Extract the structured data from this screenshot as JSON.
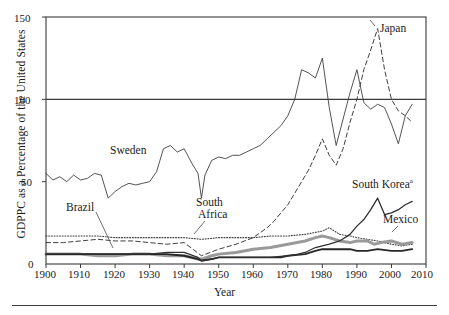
{
  "figure": {
    "ylabel": "GDPPC as a Percentage of the United States",
    "xlabel": "Year",
    "footnote_marker": "a"
  },
  "axis": {
    "y_ticks": [
      "0",
      "50",
      "100",
      "150"
    ],
    "x_ticks": [
      "1900",
      "1910",
      "1920",
      "1930",
      "1940",
      "1950",
      "1960",
      "1970",
      "1980",
      "1990",
      "2000",
      "2010"
    ]
  },
  "annotations": {
    "japan": "Japan",
    "sweden": "Sweden",
    "south_korea": "South Korea",
    "mexico": "Mexico",
    "brazil": "Brazil",
    "south_africa_l1": "South",
    "south_africa_l2": "Africa"
  },
  "colors": {
    "axis": "#3a3a3a",
    "sweden": "#404040",
    "japan": "#404040",
    "south_korea": "#303030",
    "mexico": "#9a9a9a",
    "brazil": "#262626",
    "south_africa": "#404040",
    "background": "#ffffff"
  },
  "chart_data": {
    "type": "line",
    "title": "",
    "xlabel": "Year",
    "ylabel": "GDPPC as a Percentage of the United States",
    "xlim": [
      1900,
      2010
    ],
    "ylim": [
      0,
      150
    ],
    "yticks": [
      0,
      50,
      100,
      150
    ],
    "xticks": [
      1900,
      1910,
      1920,
      1930,
      1940,
      1950,
      1960,
      1970,
      1980,
      1990,
      2000,
      2010
    ],
    "grid": false,
    "legend": "inline-annotations",
    "series": [
      {
        "name": "Sweden",
        "style": "solid-thin",
        "color": "#404040",
        "x": [
          1900,
          1902,
          1904,
          1906,
          1908,
          1910,
          1912,
          1914,
          1916,
          1918,
          1920,
          1922,
          1924,
          1926,
          1928,
          1930,
          1932,
          1934,
          1936,
          1938,
          1940,
          1942,
          1944,
          1945,
          1946,
          1948,
          1950,
          1952,
          1954,
          1956,
          1958,
          1960,
          1962,
          1964,
          1966,
          1968,
          1970,
          1972,
          1974,
          1976,
          1978,
          1980,
          1982,
          1984,
          1986,
          1988,
          1990,
          1992,
          1994,
          1996,
          1998,
          2000,
          2002,
          2004,
          2006
        ],
        "y": [
          55,
          51,
          53,
          50,
          54,
          51,
          52,
          55,
          54,
          40,
          44,
          47,
          49,
          48,
          49,
          50,
          56,
          70,
          72,
          68,
          70,
          62,
          55,
          40,
          54,
          63,
          65,
          64,
          66,
          66,
          68,
          70,
          72,
          76,
          80,
          84,
          90,
          100,
          118,
          116,
          113,
          125,
          95,
          72,
          88,
          104,
          118,
          98,
          94,
          97,
          95,
          85,
          73,
          90,
          97
        ]
      },
      {
        "name": "Japan",
        "style": "dashed",
        "color": "#404040",
        "x": [
          1900,
          1905,
          1910,
          1915,
          1920,
          1925,
          1930,
          1935,
          1940,
          1945,
          1950,
          1955,
          1960,
          1962,
          1964,
          1966,
          1968,
          1970,
          1972,
          1974,
          1976,
          1978,
          1980,
          1982,
          1984,
          1986,
          1988,
          1990,
          1992,
          1994,
          1996,
          1998,
          2000,
          2002,
          2004,
          2006
        ],
        "y": [
          13,
          13,
          14,
          15,
          14,
          14,
          13,
          12,
          13,
          5,
          9,
          12,
          16,
          19,
          22,
          26,
          31,
          36,
          43,
          50,
          57,
          66,
          76,
          66,
          60,
          70,
          86,
          100,
          118,
          130,
          143,
          118,
          100,
          93,
          90,
          86
        ]
      },
      {
        "name": "South Africa",
        "style": "dotted",
        "color": "#404040",
        "x": [
          1900,
          1905,
          1910,
          1915,
          1920,
          1925,
          1930,
          1935,
          1940,
          1945,
          1950,
          1955,
          1960,
          1965,
          1970,
          1975,
          1980,
          1982,
          1985,
          1988,
          1990,
          1993,
          1996,
          2000,
          2003,
          2006
        ],
        "y": [
          17,
          17,
          17,
          17,
          16,
          16,
          16,
          16,
          16,
          15,
          16,
          16,
          16,
          17,
          17,
          18,
          20,
          22,
          18,
          17,
          16,
          15,
          14,
          12,
          11,
          12
        ]
      },
      {
        "name": "Mexico",
        "style": "solid-thick-gray",
        "color": "#9a9a9a",
        "x": [
          1900,
          1905,
          1910,
          1915,
          1920,
          1925,
          1930,
          1935,
          1940,
          1944,
          1945,
          1948,
          1950,
          1955,
          1960,
          1965,
          1970,
          1975,
          1978,
          1980,
          1982,
          1985,
          1988,
          1990,
          1993,
          1995,
          1997,
          2000,
          2003,
          2006
        ],
        "y": [
          6,
          6,
          6,
          5,
          5,
          6,
          6,
          5,
          5,
          3,
          3,
          5,
          6,
          7,
          9,
          10,
          12,
          14,
          16,
          17,
          16,
          14,
          13,
          14,
          14,
          12,
          13,
          14,
          12,
          13
        ]
      },
      {
        "name": "Brazil",
        "style": "solid-thick-dark",
        "color": "#262626",
        "x": [
          1900,
          1905,
          1910,
          1915,
          1920,
          1925,
          1930,
          1935,
          1940,
          1944,
          1945,
          1948,
          1950,
          1955,
          1960,
          1965,
          1968,
          1970,
          1975,
          1978,
          1980,
          1982,
          1985,
          1988,
          1990,
          1993,
          1996,
          2000,
          2003,
          2006
        ],
        "y": [
          6,
          6,
          6,
          6,
          6,
          6,
          6,
          6,
          5,
          3,
          2,
          3,
          4,
          4,
          4,
          4,
          4,
          5,
          6,
          8,
          9,
          9,
          9,
          9,
          8,
          8,
          9,
          8,
          8,
          9
        ]
      },
      {
        "name": "South Korea",
        "style": "solid-dark",
        "color": "#303030",
        "x": [
          1911,
          1915,
          1920,
          1925,
          1930,
          1935,
          1940,
          1944,
          1945,
          1948,
          1950,
          1953,
          1955,
          1960,
          1965,
          1970,
          1973,
          1975,
          1978,
          1980,
          1982,
          1985,
          1988,
          1990,
          1992,
          1994,
          1996,
          1998,
          2000,
          2002,
          2004,
          2006
        ],
        "y": [
          6,
          6,
          6,
          6,
          6,
          7,
          7,
          4,
          2,
          3,
          4,
          4,
          4,
          4,
          4,
          5,
          6,
          7,
          10,
          11,
          12,
          14,
          18,
          23,
          27,
          33,
          40,
          30,
          31,
          33,
          36,
          38
        ]
      }
    ]
  }
}
